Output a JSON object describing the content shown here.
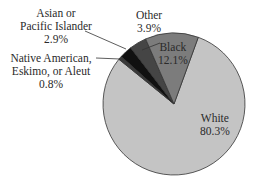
{
  "chart_data": {
    "type": "pie",
    "title": "",
    "slices": [
      {
        "label": "White",
        "value": 80.3,
        "display": "80.3%",
        "color": "#c4c4c4"
      },
      {
        "label": "Native American, Eskimo, or Aleut",
        "value": 0.8,
        "display": "0.8%",
        "color": "#3a3a3a"
      },
      {
        "label": "Asian or Pacific Islander",
        "value": 2.9,
        "display": "2.9%",
        "color": "#111111"
      },
      {
        "label": "Other",
        "value": 3.9,
        "display": "3.9%",
        "color": "#454545"
      },
      {
        "label": "Black",
        "value": 12.1,
        "display": "12.1%",
        "color": "#7c7c7c"
      }
    ],
    "categories": [
      "White",
      "Native American, Eskimo, or Aleut",
      "Asian or Pacific Islander",
      "Other",
      "Black"
    ],
    "values": [
      80.3,
      0.8,
      2.9,
      3.9,
      12.1
    ],
    "unit": "%",
    "legend": "none (direct labels)"
  },
  "labels": {
    "white": {
      "line1": "White",
      "line2": "80.3%"
    },
    "black": {
      "line1": "Black",
      "line2": "12.1%"
    },
    "other": {
      "line1": "Other",
      "line2": "3.9%"
    },
    "asian": {
      "line1": "Asian or",
      "line2": "Pacific Islander",
      "line3": "2.9%"
    },
    "native": {
      "line1": "Native American,",
      "line2": "Eskimo, or Aleut",
      "line3": "0.8%"
    }
  }
}
